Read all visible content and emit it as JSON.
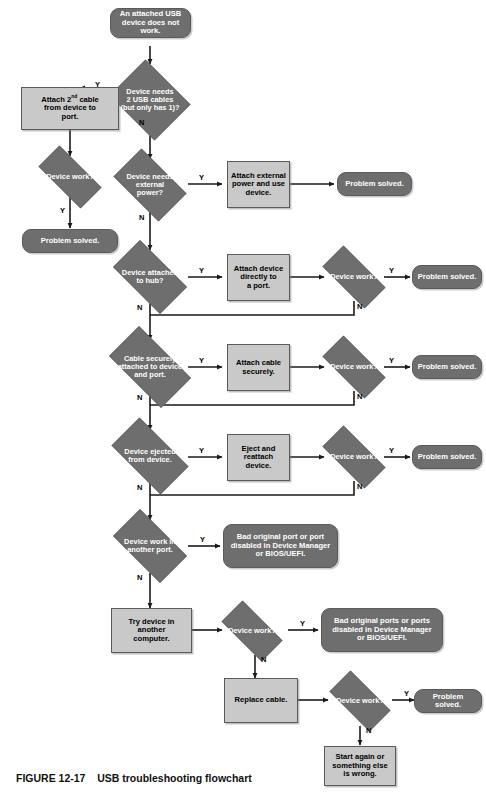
{
  "figure": {
    "caption_number": "FIGURE 12-17",
    "caption_text": "USB troubleshooting flowchart"
  },
  "colors": {
    "process_fill": "#c9c9c9",
    "decision_fill": "#6e6e6e",
    "terminator_fill": "#6e6e6e",
    "stroke": "#5a5a5a",
    "connector": "#1a1a1a",
    "process_text": "#000000",
    "decision_text": "#ffffff",
    "background": "#ffffff"
  },
  "nodes": {
    "start": {
      "type": "terminator",
      "text": "An attached USB\ndevice does not work."
    },
    "d_two_cables": {
      "type": "decision",
      "text": "Device needs\n2 USB cables\n(but only has 1)?"
    },
    "p_attach_2nd": {
      "type": "process",
      "text_pre": "Attach 2",
      "text_sup": "nd",
      "text_post": " cable\nfrom device to\nport."
    },
    "d_work_1": {
      "type": "decision",
      "text": "Device work?"
    },
    "t_solved_1": {
      "type": "terminator",
      "text": "Problem solved."
    },
    "d_ext_power": {
      "type": "decision",
      "text": "Device needs\nexternal\npower?"
    },
    "p_attach_power": {
      "type": "process",
      "text": "Attach external\npower and use\ndevice."
    },
    "t_solved_2": {
      "type": "terminator",
      "text": "Problem solved."
    },
    "d_hub": {
      "type": "decision",
      "text": "Device attached\nto hub?"
    },
    "p_attach_direct": {
      "type": "process",
      "text": "Attach device\ndirectly to\na port."
    },
    "d_work_2": {
      "type": "decision",
      "text": "Device work?"
    },
    "t_solved_3": {
      "type": "terminator",
      "text": "Problem solved."
    },
    "d_cable_secure": {
      "type": "decision",
      "text": "Cable securely\nattached to device\nand port."
    },
    "p_attach_secure": {
      "type": "process",
      "text": "Attach cable\nsecurely."
    },
    "d_work_3": {
      "type": "decision",
      "text": "Device work?"
    },
    "t_solved_4": {
      "type": "terminator",
      "text": "Problem solved."
    },
    "d_ejected": {
      "type": "decision",
      "text": "Device ejected\nfrom device."
    },
    "p_eject_reattach": {
      "type": "process",
      "text": "Eject and\nreattach device."
    },
    "d_work_4": {
      "type": "decision",
      "text": "Device work?"
    },
    "t_solved_5": {
      "type": "terminator",
      "text": "Problem solved."
    },
    "d_another_port": {
      "type": "decision",
      "text": "Device work in\nanother port."
    },
    "t_bad_port": {
      "type": "terminator",
      "text": "Bad original port or port\ndisabled in Device Manager\nor BIOS/UEFI."
    },
    "p_another_computer": {
      "type": "process",
      "text": "Try device in\nanother\ncomputer."
    },
    "d_work_5": {
      "type": "decision",
      "text": "Device work?"
    },
    "t_bad_ports": {
      "type": "terminator",
      "text": "Bad original ports or ports\ndisabled in Device Manager\nor BIOS/UEFI."
    },
    "p_replace_cable": {
      "type": "process",
      "text": "Replace cable."
    },
    "d_work_6": {
      "type": "decision",
      "text": "Device work?"
    },
    "t_solved_6": {
      "type": "terminator",
      "text": "Problem solved."
    },
    "p_start_again": {
      "type": "process",
      "text": "Start again or\nsomething else\nis wrong."
    }
  },
  "edge_labels": {
    "y1": "Y",
    "n1": "N",
    "y2": "Y",
    "n2": "N",
    "y3": "Y",
    "n3": "N",
    "y4": "Y",
    "n4": "N",
    "y5": "Y",
    "n5": "N",
    "y6": "Y",
    "n6": "N",
    "y7": "Y",
    "n7": "N",
    "y8": "Y",
    "n8": "N",
    "y9": "Y",
    "n9": "N",
    "y10": "Y",
    "n10": "N",
    "y11": "Y",
    "n11": "N",
    "y12": "Y",
    "n12": "N"
  }
}
